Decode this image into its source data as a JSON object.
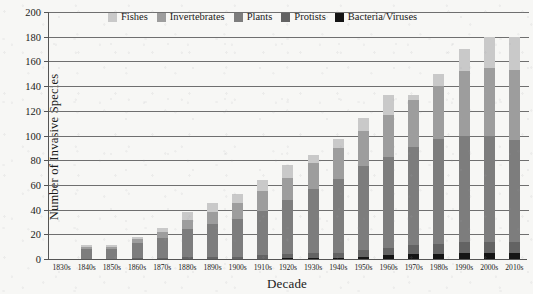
{
  "chart_data": {
    "type": "bar",
    "subtype": "stacked-bar",
    "title": "",
    "xlabel": "Decade",
    "ylabel": "Number of Invasive Species",
    "ylim": [
      0,
      200
    ],
    "ytick_step": 20,
    "yticks": [
      0,
      20,
      40,
      60,
      80,
      100,
      120,
      140,
      160,
      180,
      200
    ],
    "grid": "horizontal",
    "legend_position": "top-center-inside",
    "categories": [
      "1830s",
      "1840s",
      "1850s",
      "1860s",
      "1870s",
      "1880s",
      "1890s",
      "1900s",
      "1910s",
      "1920s",
      "1930s",
      "1940s",
      "1950s",
      "1960s",
      "1970s",
      "1980s",
      "1990s",
      "2000s",
      "2010s"
    ],
    "series": [
      {
        "name": "Bacteria/Viruses",
        "color": "#141414",
        "values": [
          0,
          0,
          0,
          0,
          0,
          0,
          0,
          0,
          0,
          1,
          1,
          1,
          2,
          3,
          4,
          4,
          5,
          5,
          5
        ]
      },
      {
        "name": "Protists",
        "color": "#636363",
        "values": [
          0,
          0,
          0,
          1,
          1,
          2,
          2,
          2,
          3,
          3,
          4,
          4,
          5,
          6,
          7,
          8,
          9,
          9,
          9
        ]
      },
      {
        "name": "Plants",
        "color": "#7d7d7d",
        "values": [
          0,
          8,
          8,
          12,
          16,
          22,
          26,
          30,
          36,
          44,
          52,
          60,
          68,
          74,
          80,
          85,
          86,
          86,
          82
        ]
      },
      {
        "name": "Invertebrates",
        "color": "#9d9d9d",
        "values": [
          0,
          2,
          2,
          3,
          5,
          8,
          10,
          13,
          16,
          18,
          21,
          25,
          29,
          34,
          38,
          43,
          52,
          55,
          57
        ]
      },
      {
        "name": "Fishes",
        "color": "#c9c9c9",
        "values": [
          0,
          1,
          1,
          2,
          3,
          6,
          7,
          8,
          9,
          10,
          6,
          7,
          10,
          16,
          4,
          10,
          18,
          25,
          27
        ]
      }
    ],
    "totals": [
      0,
      11,
      11,
      18,
      25,
      38,
      45,
      53,
      64,
      76,
      84,
      97,
      114,
      133,
      133,
      150,
      170,
      180,
      180
    ]
  }
}
